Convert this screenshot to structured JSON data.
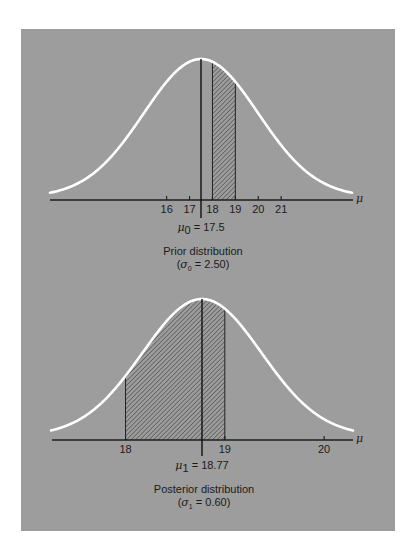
{
  "figure": {
    "background": "#ffffff",
    "panel_color": "#9d9d9d",
    "curve_color": "#ffffff",
    "hatch_color": "#2a2a2a",
    "axis_symbol": "μ"
  },
  "chart_data": [
    {
      "type": "area",
      "title": "Prior distribution",
      "subtitle": "(σ0 = 2.50)",
      "distribution": "normal",
      "mean": 17.5,
      "sd": 2.5,
      "mean_label": "μ0 = 17.5",
      "mean_label_parts": {
        "sym": "μ",
        "sub": "0",
        "rest": " = 17.5"
      },
      "caption_line1": "Prior distribution",
      "caption_line2_parts": {
        "open": "(",
        "sym": "σ",
        "sub": "0",
        "rest": " = 2.50)"
      },
      "xlabel": "μ",
      "x_ticks": [
        16,
        17,
        18,
        19,
        20,
        21
      ],
      "x_tick_labels": [
        "16",
        "17",
        "18",
        "19",
        "20",
        "21"
      ],
      "shaded_interval": [
        18,
        19
      ],
      "shading": "hatched",
      "grid": false,
      "layout": {
        "x0": 201,
        "px_per_unit": 22.9,
        "baseline": 197,
        "axis_y": 200,
        "peak_y": 59,
        "axis_left": 50,
        "axis_right": 353,
        "curve_half_width": 151,
        "mean_line_top": 59,
        "mean_line_bottom": 218
      }
    },
    {
      "type": "area",
      "title": "Posterior distribution",
      "subtitle": "(σ1 = 0.60)",
      "distribution": "normal",
      "mean": 18.77,
      "sd": 0.6,
      "mean_label": "μ1 = 18.77",
      "mean_label_parts": {
        "sym": "μ",
        "sub": "1",
        "rest": " = 18.77"
      },
      "caption_line1": "Posterior distribution",
      "caption_line2_parts": {
        "open": "(",
        "sym": "σ",
        "sub": "1",
        "rest": " = 0.60)"
      },
      "xlabel": "μ",
      "x_ticks": [
        18,
        19,
        20
      ],
      "x_tick_labels": [
        "18",
        "19",
        "20"
      ],
      "shaded_interval": [
        18,
        19
      ],
      "shading": "hatched",
      "grid": false,
      "layout": {
        "x0": 202,
        "px_per_unit": 99.3,
        "baseline": 436,
        "axis_y": 440,
        "peak_y": 299,
        "axis_left": 52,
        "axis_right": 353,
        "curve_half_width": 151,
        "mean_line_top": 299,
        "mean_line_bottom": 456
      }
    }
  ]
}
